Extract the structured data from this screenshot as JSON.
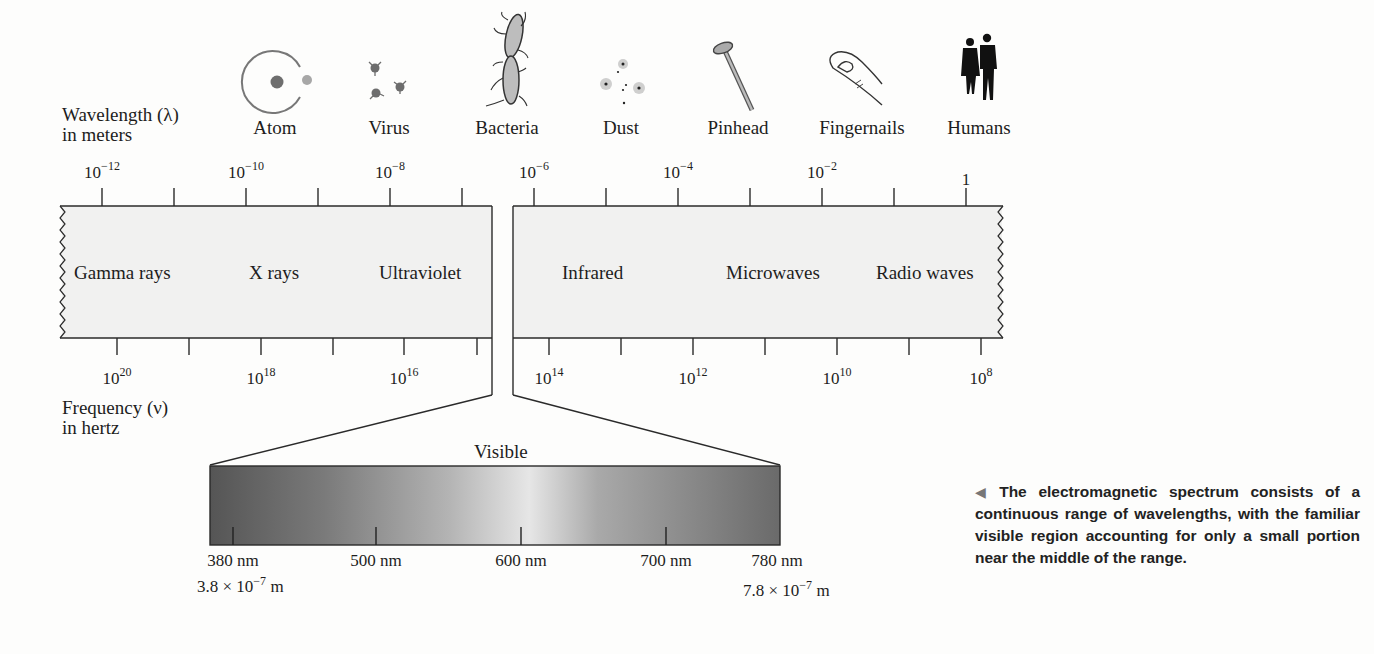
{
  "axes": {
    "wavelength_label_line1": "Wavelength (λ)",
    "wavelength_label_line2": "in meters",
    "frequency_label_line1": "Frequency (ν)",
    "frequency_label_line2": "in hertz"
  },
  "objects": [
    {
      "name": "Atom",
      "icon": "atom-icon"
    },
    {
      "name": "Virus",
      "icon": "virus-icon"
    },
    {
      "name": "Bacteria",
      "icon": "bacteria-icon"
    },
    {
      "name": "Dust",
      "icon": "dust-icon"
    },
    {
      "name": "Pinhead",
      "icon": "pinhead-icon"
    },
    {
      "name": "Fingernails",
      "icon": "fingernail-icon"
    },
    {
      "name": "Humans",
      "icon": "humans-icon"
    }
  ],
  "wavelength_ticks": [
    {
      "base": "10",
      "exp": "−12"
    },
    {
      "base": "10",
      "exp": "−10"
    },
    {
      "base": "10",
      "exp": "−8"
    },
    {
      "base": "10",
      "exp": "−6"
    },
    {
      "base": "10",
      "exp": "−4"
    },
    {
      "base": "10",
      "exp": "−2"
    },
    {
      "base": "1",
      "exp": ""
    }
  ],
  "frequency_ticks": [
    {
      "base": "10",
      "exp": "20"
    },
    {
      "base": "10",
      "exp": "18"
    },
    {
      "base": "10",
      "exp": "16"
    },
    {
      "base": "10",
      "exp": "14"
    },
    {
      "base": "10",
      "exp": "12"
    },
    {
      "base": "10",
      "exp": "10"
    },
    {
      "base": "10",
      "exp": "8"
    }
  ],
  "regions": [
    "Gamma rays",
    "X rays",
    "Ultraviolet",
    "Infrared",
    "Microwaves",
    "Radio waves"
  ],
  "visible": {
    "title": "Visible",
    "ticks": [
      "380 nm",
      "500 nm",
      "600 nm",
      "700 nm",
      "780 nm"
    ],
    "left_m_base": "3.8 × 10",
    "left_m_exp": "−7",
    "left_m_unit": " m",
    "right_m_base": "7.8 × 10",
    "right_m_exp": "−7",
    "right_m_unit": " m"
  },
  "caption": {
    "arrow": "◀",
    "text": "The electromagnetic spectrum consists of a continuous range of wavelengths, with the familiar visible region accounting for only a small portion near the middle of the range."
  },
  "colors": {
    "band_fill": "#f1f1f0",
    "line": "#2a2a2a",
    "visible_dark": "#5c5c5c",
    "visible_light": "#e3e3e3"
  }
}
